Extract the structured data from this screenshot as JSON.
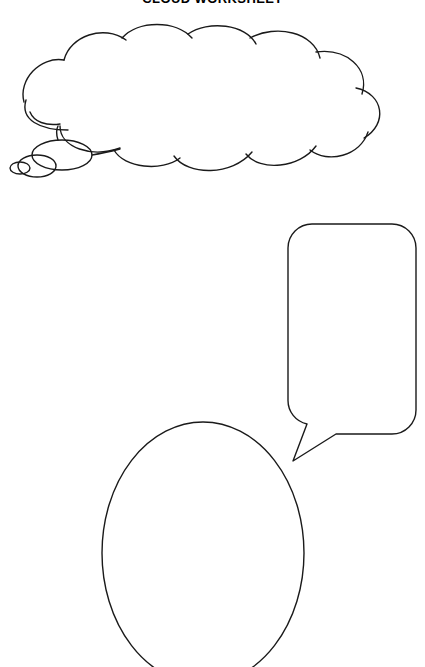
{
  "page": {
    "title": "CLOUD WORKSHEET",
    "title_visible_note": "cropped at top edge",
    "background_color": "#ffffff",
    "ink_color": "#1a1a1a",
    "width": 425,
    "height": 667
  },
  "shapes": [
    {
      "id": "thought-cloud",
      "name": "thought-bubble-cloud",
      "label": "",
      "type": "thought-bubble",
      "bumps_top": 4,
      "bumps_left": 2,
      "bumps_right": 2,
      "bumps_bottom": 3,
      "tail_bubbles": 3,
      "tail_direction": "down-left"
    },
    {
      "id": "speech-bubble",
      "name": "speech-bubble-rounded-rect",
      "label": "",
      "type": "speech-bubble",
      "corner_radius": 24,
      "tail_direction": "down-left"
    },
    {
      "id": "face-oval",
      "name": "blank-face-oval",
      "label": "",
      "type": "ellipse",
      "cropped_bottom": true
    }
  ]
}
